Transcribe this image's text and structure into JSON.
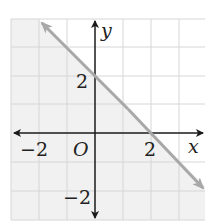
{
  "graph": {
    "equation": "y = -x + 2",
    "shaded_region": "below line",
    "axis_labels": {
      "x": "x",
      "y": "y"
    },
    "origin_label": "O",
    "tick_labels": {
      "x_neg": "−2",
      "x_pos": "2",
      "y_pos": "2",
      "y_neg": "−2"
    },
    "grid": {
      "x_range": [
        -3,
        4
      ],
      "y_range": [
        -3,
        4
      ]
    },
    "colors": {
      "line": "#a8a8a8",
      "grid": "#d6d6d6",
      "axes": "#1a1a1a",
      "shade": "#f1f1f1",
      "background": "#ffffff"
    }
  }
}
